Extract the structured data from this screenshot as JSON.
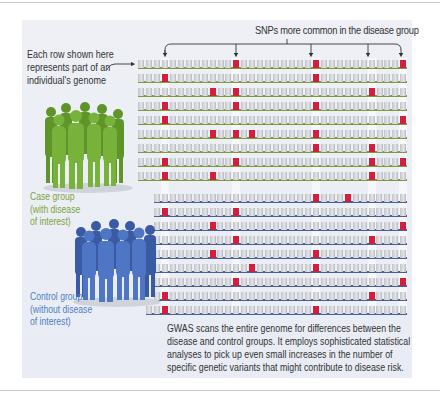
{
  "figure": {
    "title": "SNPs more common in the disease group",
    "intro_lines": [
      "Each row shown here",
      "represents part of an",
      "individual's genome"
    ],
    "case_group": {
      "label_lines": [
        "Case group",
        "(with disease",
        "of interest)"
      ],
      "color": "#7ea43a",
      "figure_color": "#6fa02e"
    },
    "control_group": {
      "label_lines": [
        "Control group",
        "(without disease",
        "of interest)"
      ],
      "color": "#4d7fc4",
      "figure_color": "#3f66b3"
    },
    "caption_lines": [
      "GWAS scans the entire genome for differences between the",
      "disease and control groups. It employs sophisticated statistical",
      "analyses to pick up even small increases in the number of",
      "specific genetic variants that might contribute to disease risk."
    ],
    "colors": {
      "snp": "#d41f3c",
      "case_baseline": "#7e9a3a",
      "control_baseline": "#4a5f96",
      "panel": "#eceef5"
    },
    "grid": {
      "columns": 34,
      "highlighted_snp_columns": [
        3,
        12,
        22,
        29,
        33
      ]
    },
    "case_rows": [
      [
        12,
        22,
        33
      ],
      [
        3,
        22
      ],
      [
        9,
        12,
        29
      ],
      [
        3,
        12,
        22
      ],
      [
        3,
        33
      ],
      [
        9,
        12,
        14,
        22
      ],
      [
        22,
        29
      ],
      [
        3,
        12,
        29,
        33
      ],
      [
        3,
        9,
        29
      ]
    ],
    "control_rows": [
      [
        22,
        26
      ],
      [
        3,
        12
      ],
      [
        9,
        33
      ],
      [
        12,
        29
      ],
      [
        9,
        22
      ],
      [
        14,
        22
      ],
      [
        12,
        33
      ],
      [
        3,
        29
      ],
      [
        3,
        22
      ]
    ]
  }
}
